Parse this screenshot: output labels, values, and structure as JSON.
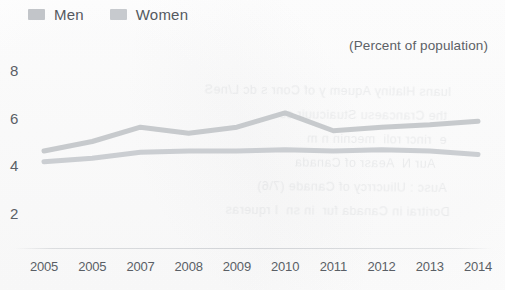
{
  "legend": {
    "entries": [
      {
        "label": "Men",
        "color": "#c2c5c9"
      },
      {
        "label": "Women",
        "color": "#c7cace"
      }
    ]
  },
  "subtitle": "(Percent of population)",
  "bleed_text": "  luans Hlatiny Aquem y of Conr s dc L/neS\n   the Crancaesu Stuaicuuir ce\n   e  rincr roli  mecnin n m\n      Aur N  Aeasr of Canada\n   Ausc : Uliucrrcy of Canade (7\\6)\n  Doritrai in Canada fur  in sn  I rqueras",
  "chart_data": {
    "type": "line",
    "title": "",
    "subtitle": "(Percent of population)",
    "xlabel": "",
    "ylabel": "",
    "ylim": [
      0,
      8.6
    ],
    "yticks": [
      2,
      4,
      6,
      8
    ],
    "grid": false,
    "legend_position": "top-left",
    "categories": [
      "2005",
      "2005",
      "2007",
      "2008",
      "2009",
      "2010",
      "2011",
      "2012",
      "2013",
      "2014"
    ],
    "series": [
      {
        "name": "Men",
        "color": "#c2c5c9",
        "values": [
          4.6,
          5.0,
          5.6,
          5.35,
          5.6,
          6.2,
          5.45,
          5.6,
          5.7,
          5.85
        ]
      },
      {
        "name": "Women",
        "color": "#c7cace",
        "values": [
          4.15,
          4.3,
          4.55,
          4.6,
          4.6,
          4.65,
          4.6,
          4.65,
          4.6,
          4.45
        ]
      }
    ]
  }
}
